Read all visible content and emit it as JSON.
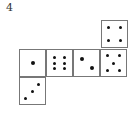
{
  "problem_number": "4",
  "net": {
    "faces": [
      {
        "id": "top-right",
        "value": 4,
        "x": 101,
        "y": 20,
        "pips": [
          [
            25,
            25
          ],
          [
            75,
            25
          ],
          [
            25,
            75
          ],
          [
            75,
            75
          ]
        ]
      },
      {
        "id": "row-1",
        "value": 1,
        "x": 19,
        "y": 49,
        "pips": [
          [
            50,
            50
          ]
        ],
        "big": true
      },
      {
        "id": "row-2",
        "value": 6,
        "x": 46,
        "y": 49,
        "pips": [
          [
            30,
            28
          ],
          [
            70,
            28
          ],
          [
            30,
            50
          ],
          [
            70,
            50
          ],
          [
            30,
            72
          ],
          [
            70,
            72
          ]
        ]
      },
      {
        "id": "row-3",
        "value": 2,
        "x": 73,
        "y": 49,
        "pips": [
          [
            30,
            35
          ],
          [
            70,
            70
          ]
        ],
        "big": true
      },
      {
        "id": "row-4",
        "value": 5,
        "x": 100,
        "y": 49,
        "pips": [
          [
            25,
            22
          ],
          [
            75,
            22
          ],
          [
            50,
            50
          ],
          [
            25,
            78
          ],
          [
            75,
            78
          ]
        ]
      },
      {
        "id": "bottom-left",
        "value": 3,
        "x": 19,
        "y": 77,
        "pips": [
          [
            75,
            25
          ],
          [
            50,
            50
          ],
          [
            22,
            78
          ]
        ]
      }
    ]
  }
}
